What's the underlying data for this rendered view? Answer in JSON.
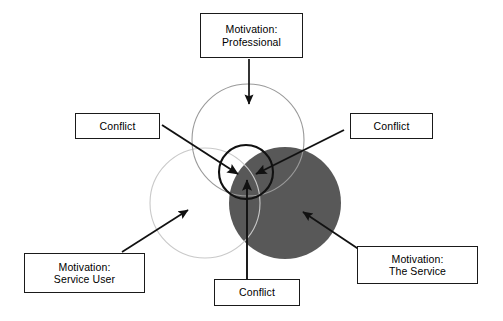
{
  "diagram": {
    "type": "venn-three-circle-conflict",
    "title_text": "",
    "colors": {
      "service_circle_fill": "#585858",
      "outline_light": "#c9c9c9",
      "outline_mid": "#9a9a9a",
      "center_circle_stroke": "#111111",
      "arrow_color": "#111111",
      "box_border": "#1a1a1a",
      "box_fill": "#ffffff",
      "text_color": "#000000",
      "background": "#ffffff"
    },
    "circles": [
      {
        "name": "professional-circle",
        "label_ref": "Motivation: Professional",
        "cx": 248,
        "cy": 140,
        "r": 56,
        "fill": "none",
        "stroke": "#9a9a9a"
      },
      {
        "name": "service-user-circle",
        "label_ref": "Motivation: Service User",
        "cx": 205,
        "cy": 203,
        "r": 55,
        "fill": "none",
        "stroke": "#c9c9c9"
      },
      {
        "name": "the-service-circle",
        "label_ref": "Motivation: The Service",
        "cx": 285,
        "cy": 203,
        "r": 56,
        "fill": "#585858",
        "stroke": "none"
      },
      {
        "name": "conflict-overlap-circle",
        "label_ref": "central conflict zone",
        "cx": 246,
        "cy": 172,
        "r": 27,
        "fill": "none",
        "stroke": "#111111"
      }
    ],
    "boxes": [
      {
        "id": "motivation-professional",
        "line1": "Motivation:",
        "line2": "Professional",
        "position": "top-center"
      },
      {
        "id": "conflict-left",
        "line1": "Conflict",
        "line2": "",
        "position": "left-upper"
      },
      {
        "id": "conflict-right",
        "line1": "Conflict",
        "line2": "",
        "position": "right-upper"
      },
      {
        "id": "motivation-service-user",
        "line1": "Motivation:",
        "line2": "Service User",
        "position": "bottom-left"
      },
      {
        "id": "motivation-the-service",
        "line1": "Motivation:",
        "line2": "The Service",
        "position": "bottom-right"
      },
      {
        "id": "conflict-bottom",
        "line1": "Conflict",
        "line2": "",
        "position": "bottom-center"
      }
    ],
    "arrows": [
      {
        "name": "arrow-professional-to-circle",
        "from_box": "motivation-professional",
        "x1": 249,
        "y1": 59,
        "x2": 249,
        "y2": 106,
        "points_to": "professional-circle"
      },
      {
        "name": "arrow-conflict-left-to-center",
        "from_box": "conflict-left",
        "x1": 162,
        "y1": 125,
        "x2": 240,
        "y2": 175,
        "points_to": "conflict-overlap-circle"
      },
      {
        "name": "arrow-conflict-right-to-center",
        "from_box": "conflict-right",
        "x1": 344,
        "y1": 130,
        "x2": 254,
        "y2": 175,
        "points_to": "conflict-overlap-circle"
      },
      {
        "name": "arrow-conflict-bottom-to-center",
        "from_box": "conflict-bottom",
        "x1": 247,
        "y1": 279,
        "x2": 247,
        "y2": 178,
        "points_to": "conflict-overlap-circle"
      },
      {
        "name": "arrow-service-user-to-circle",
        "from_box": "motivation-service-user",
        "x1": 122,
        "y1": 252,
        "x2": 189,
        "y2": 209,
        "points_to": "service-user-circle"
      },
      {
        "name": "arrow-the-service-to-circle",
        "from_box": "motivation-the-service",
        "x1": 358,
        "y1": 250,
        "x2": 302,
        "y2": 211,
        "points_to": "the-service-circle"
      }
    ]
  }
}
